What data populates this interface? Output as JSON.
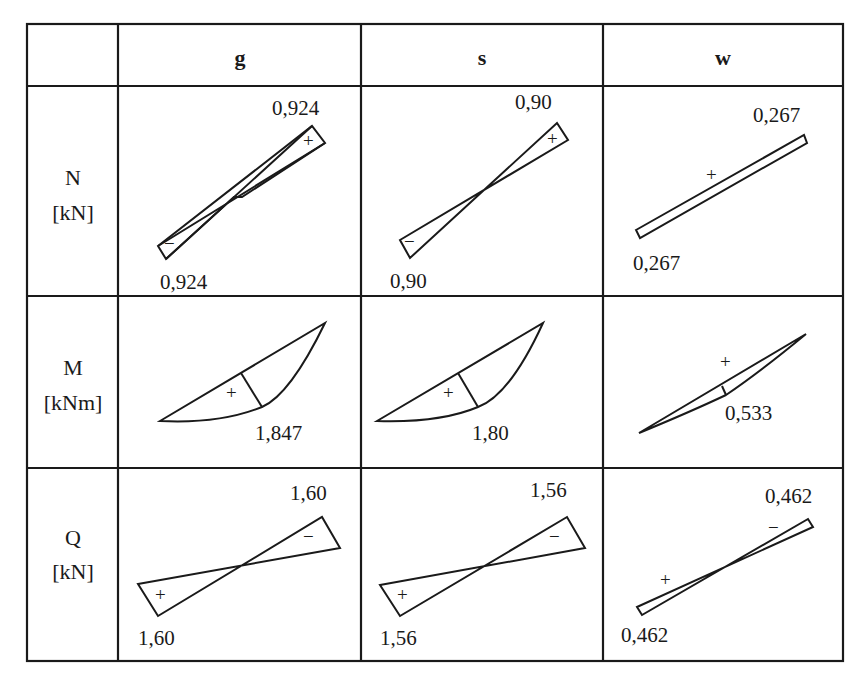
{
  "table": {
    "header": {
      "corner": "",
      "columns": [
        "g",
        "s",
        "w"
      ]
    },
    "rows": [
      {
        "name": "N",
        "unit": "[kN]",
        "cells": [
          {
            "value_top": "0,924",
            "value_bottom": "0,924",
            "sign_top": "+",
            "sign_bottom": "−"
          },
          {
            "value_top": "0,90",
            "value_bottom": "0,90",
            "sign_top": "+",
            "sign_bottom": "−"
          },
          {
            "value_top": "0,267",
            "value_bottom": "0,267",
            "sign": "+"
          }
        ]
      },
      {
        "name": "M",
        "unit": "[kNm]",
        "cells": [
          {
            "value": "1,847",
            "sign": "+"
          },
          {
            "value": "1,80",
            "sign": "+"
          },
          {
            "value": "0,533",
            "sign": "+"
          }
        ]
      },
      {
        "name": "Q",
        "unit": "[kN]",
        "cells": [
          {
            "value_top": "1,60",
            "value_bottom": "1,60",
            "sign_top": "−",
            "sign_bottom": "+"
          },
          {
            "value_top": "1,56",
            "value_bottom": "1,56",
            "sign_top": "−",
            "sign_bottom": "+"
          },
          {
            "value_top": "0,462",
            "value_bottom": "0,462",
            "sign_top": "−",
            "sign_bottom": "+"
          }
        ]
      }
    ]
  }
}
